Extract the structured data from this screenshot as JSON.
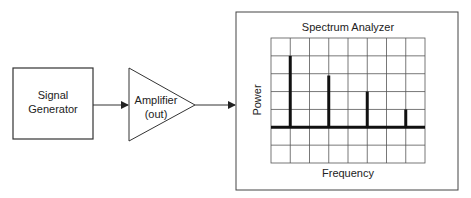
{
  "diagram": {
    "signal_generator": {
      "line1": "Signal",
      "line2": "Generator"
    },
    "amplifier": {
      "line1": "Amplifier",
      "line2": "(out)"
    },
    "analyzer": {
      "title": "Spectrum Analyzer",
      "y_label": "Power",
      "x_label": "Frequency"
    }
  },
  "chart_data": {
    "type": "bar",
    "title": "Spectrum Analyzer",
    "xlabel": "Frequency",
    "ylabel": "Power",
    "grid": true,
    "grid_columns": 8,
    "grid_rows": 7,
    "baseline_row_from_top": 5,
    "peaks": [
      {
        "x_gridline": 1,
        "height_divisions": 4.0
      },
      {
        "x_gridline": 3,
        "height_divisions": 2.9
      },
      {
        "x_gridline": 5,
        "height_divisions": 2.0
      },
      {
        "x_gridline": 7,
        "height_divisions": 1.0
      }
    ]
  }
}
